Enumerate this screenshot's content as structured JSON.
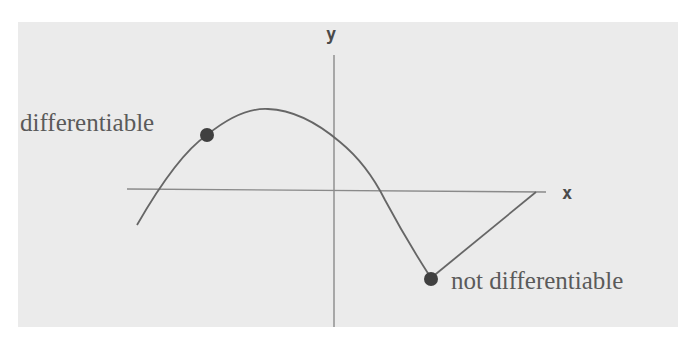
{
  "figure": {
    "axes": {
      "x_label": "x",
      "y_label": "y"
    },
    "annotations": [
      {
        "id": "smooth-point",
        "label": "differentiable"
      },
      {
        "id": "corner-point",
        "label": "not differentiable"
      }
    ],
    "colors": {
      "background": "#ebebeb",
      "axis": "#8a8a8a",
      "curve": "#666666",
      "point": "#404040",
      "label": "#5a5a5a"
    }
  }
}
